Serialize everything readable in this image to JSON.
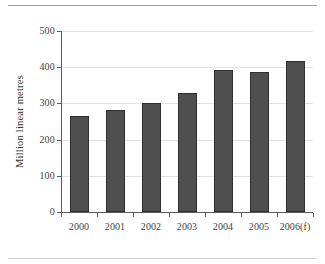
{
  "chart_data": {
    "type": "bar",
    "title": "",
    "xlabel": "",
    "ylabel": "Million linear metres",
    "categories": [
      "2000",
      "2001",
      "2002",
      "2003",
      "2004",
      "2005",
      "2006(f)"
    ],
    "values": [
      265,
      283,
      301,
      329,
      392,
      388,
      417
    ],
    "ylim": [
      0,
      500
    ],
    "ytick_labels": [
      "0",
      "100",
      "200",
      "300",
      "400",
      "500"
    ],
    "ytick_values": [
      0,
      100,
      200,
      300,
      400,
      500
    ],
    "grid": "horizontal",
    "legend": "none",
    "bar_color": "#4f4f4f",
    "bar_edge_color": "#2f2f2f",
    "gridline_color": "#e2e2e2",
    "axis_color": "#5b5b5b",
    "background_color": "#ffffff"
  }
}
